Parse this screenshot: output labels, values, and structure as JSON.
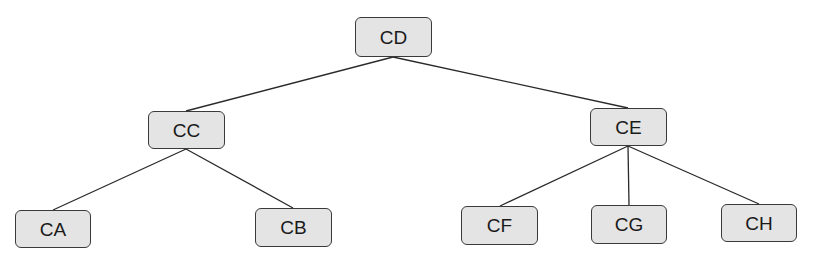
{
  "diagram": {
    "type": "tree",
    "colors": {
      "node_fill": "#e4e4e4",
      "node_border": "#3a3a3a",
      "edge": "#2a2a2a",
      "text": "#1a1a1a"
    },
    "nodes": {
      "CD": {
        "label": "CD"
      },
      "CC": {
        "label": "CC"
      },
      "CE": {
        "label": "CE"
      },
      "CA": {
        "label": "CA"
      },
      "CB": {
        "label": "CB"
      },
      "CF": {
        "label": "CF"
      },
      "CG": {
        "label": "CG"
      },
      "CH": {
        "label": "CH"
      }
    },
    "edges": [
      {
        "from": "CD",
        "to": "CC"
      },
      {
        "from": "CD",
        "to": "CE"
      },
      {
        "from": "CC",
        "to": "CA"
      },
      {
        "from": "CC",
        "to": "CB"
      },
      {
        "from": "CE",
        "to": "CF"
      },
      {
        "from": "CE",
        "to": "CG"
      },
      {
        "from": "CE",
        "to": "CH"
      }
    ]
  }
}
